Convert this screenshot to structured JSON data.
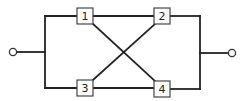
{
  "diagram": {
    "type": "reliability-block-diagram",
    "colors": {
      "line": "#222222",
      "box_border": "#444444",
      "background": "#ffffff"
    },
    "terminals": [
      {
        "id": "input",
        "label": ""
      },
      {
        "id": "output",
        "label": ""
      }
    ],
    "blocks": [
      {
        "id": "1",
        "label": "1"
      },
      {
        "id": "2",
        "label": "2"
      },
      {
        "id": "3",
        "label": "3"
      },
      {
        "id": "4",
        "label": "4"
      }
    ],
    "connections": [
      {
        "from": "input",
        "to": "1"
      },
      {
        "from": "input",
        "to": "3"
      },
      {
        "from": "1",
        "to": "2"
      },
      {
        "from": "3",
        "to": "4"
      },
      {
        "from": "1",
        "to": "4"
      },
      {
        "from": "3",
        "to": "2"
      },
      {
        "from": "2",
        "to": "output"
      },
      {
        "from": "4",
        "to": "output"
      }
    ]
  }
}
